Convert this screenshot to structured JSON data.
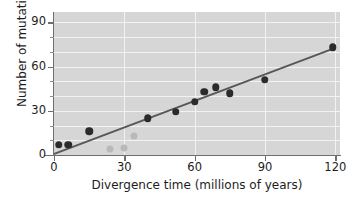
{
  "chart_data": {
    "type": "scatter",
    "title": "",
    "xlabel": "Divergence time (millions of years)",
    "ylabel": "Number of mutations",
    "xlim": [
      0,
      122
    ],
    "ylim": [
      0,
      97
    ],
    "xticks": [
      0,
      30,
      60,
      90,
      120
    ],
    "yticks": [
      0,
      30,
      60,
      90
    ],
    "y_minor_ticks": [
      10,
      20,
      40,
      50,
      70,
      80
    ],
    "grid": "white gridlines; horizontal every 10 units, vertical every 30 units",
    "legend": "none",
    "series": [
      {
        "name": "data points",
        "color": "#2b2b2b",
        "points": [
          {
            "x": 2,
            "y": 7
          },
          {
            "x": 6,
            "y": 7
          },
          {
            "x": 15,
            "y": 16
          },
          {
            "x": 40,
            "y": 25
          },
          {
            "x": 52,
            "y": 29.5
          },
          {
            "x": 60,
            "y": 36
          },
          {
            "x": 64,
            "y": 43
          },
          {
            "x": 69,
            "y": 46
          },
          {
            "x": 75,
            "y": 42
          },
          {
            "x": 90,
            "y": 51
          },
          {
            "x": 119,
            "y": 73
          }
        ]
      },
      {
        "name": "faded points",
        "color": "#b9b9b9",
        "points": [
          {
            "x": 24,
            "y": 4
          },
          {
            "x": 30,
            "y": 4.5
          },
          {
            "x": 34,
            "y": 13
          }
        ]
      }
    ],
    "trendline": {
      "name": "best fit line",
      "color": "#575757",
      "x0": 0,
      "y0": 1.5,
      "x1": 120,
      "y1": 73.5
    }
  },
  "axes": {
    "x_tick_labels": [
      "0",
      "30",
      "60",
      "90",
      "120"
    ],
    "y_tick_labels": [
      "0",
      "30",
      "60",
      "90"
    ],
    "x_title": "Divergence time (millions of years)",
    "y_title": "Number of mutations"
  }
}
